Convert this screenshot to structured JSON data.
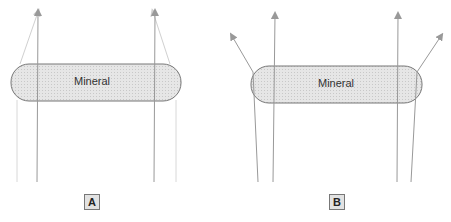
{
  "diagram": {
    "panels": [
      {
        "id": "A",
        "label": "A",
        "mineral_label": "Mineral",
        "description": "Light rays pass through mineral grain; rays converge upward (faint rays bend inward)"
      },
      {
        "id": "B",
        "label": "B",
        "mineral_label": "Mineral",
        "description": "Light rays pass through mineral grain; edge rays bend outward"
      }
    ],
    "colors": {
      "mineral_fill": "#e0e0e0",
      "mineral_stroke": "#777777",
      "ray": "#999999",
      "faint_ray": "#d0d0d0",
      "label_box_fill": "#e2e2e2"
    }
  }
}
